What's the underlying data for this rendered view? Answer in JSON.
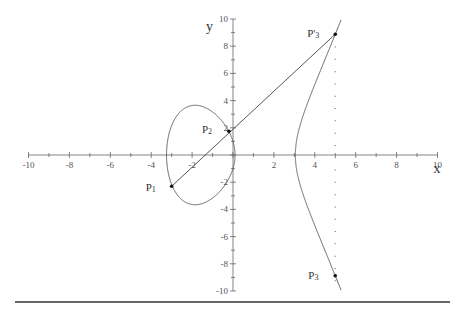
{
  "diagram": {
    "axes": {
      "x_label": "x",
      "y_label": "y",
      "x_range": [
        -10,
        10
      ],
      "y_range": [
        -10,
        10
      ],
      "x_ticks": [
        "-10",
        "-8",
        "-6",
        "-4",
        "-2",
        "2",
        "4",
        "6",
        "8",
        "10"
      ],
      "y_ticks": [
        "10",
        "8",
        "6",
        "4",
        "2",
        "-2",
        "-4",
        "-6",
        "-8",
        "-10"
      ]
    },
    "curve": {
      "equation_roots": [
        -3.25,
        0.1,
        3.05
      ],
      "color": "#555555"
    },
    "points": [
      {
        "id": "P1",
        "label": "P",
        "sub": "1",
        "x": -3.0,
        "y": -2.3
      },
      {
        "id": "P2",
        "label": "P",
        "sub": "2",
        "x": -0.2,
        "y": 1.75
      },
      {
        "id": "P3prime",
        "label": "P'",
        "sub": "3",
        "x": 5.0,
        "y": 8.88
      },
      {
        "id": "P3",
        "label": "P",
        "sub": "3",
        "x": 5.0,
        "y": -8.88
      }
    ],
    "secant_line": {
      "from": "P1",
      "to": "P3prime"
    },
    "reflection_line": {
      "x": 5.0,
      "style": "dotted"
    }
  }
}
